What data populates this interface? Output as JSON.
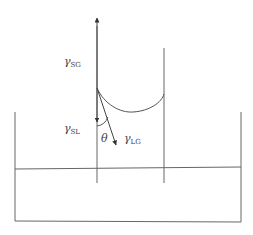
{
  "diagram": {
    "type": "capillary-rise-contact-angle",
    "colors": {
      "line": "#555555",
      "background": "#ffffff",
      "text": "#444444"
    },
    "labels": {
      "gamma_sg": {
        "symbol": "γ",
        "sub": "SG"
      },
      "gamma_sl": {
        "symbol": "γ",
        "sub": "SL"
      },
      "gamma_lg": {
        "symbol": "γ",
        "sub": "LG"
      },
      "theta": "θ"
    },
    "elements": [
      "container",
      "liquid-surface",
      "capillary-tube-left-wall",
      "capillary-tube-right-wall",
      "meniscus",
      "arrow-gamma-sg-up",
      "arrow-gamma-sl-down",
      "arrow-gamma-lg-tangent",
      "contact-angle-arc"
    ]
  }
}
